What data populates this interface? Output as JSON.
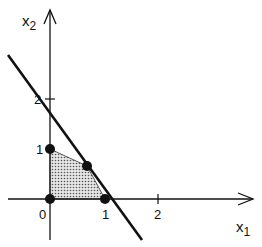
{
  "diagram": {
    "type": "linear-program-feasible-region",
    "axes": {
      "x_label": "x",
      "x_subscript": "1",
      "y_label": "x",
      "y_subscript": "2"
    },
    "ticks": {
      "x": [
        {
          "value": 0,
          "label": "0"
        },
        {
          "value": 1,
          "label": "1"
        },
        {
          "value": 2,
          "label": "2"
        }
      ],
      "y": [
        {
          "value": 1,
          "label": "1"
        },
        {
          "value": 2,
          "label": "2"
        }
      ]
    },
    "constraint_line": {
      "description": "boundary line crossing x2-axis near 1.9 and x1-axis near 1.1"
    },
    "feasible_region_vertices": [
      {
        "x1": 0,
        "x2": 0
      },
      {
        "x1": 1,
        "x2": 0
      },
      {
        "x1": 0.7,
        "x2": 0.65
      },
      {
        "x1": 0,
        "x2": 1
      }
    ],
    "marked_points": [
      {
        "name": "origin",
        "x1": 0,
        "x2": 0
      },
      {
        "name": "x1-intercept",
        "x1": 1,
        "x2": 0
      },
      {
        "name": "interior-vertex",
        "x1": 0.7,
        "x2": 0.65
      },
      {
        "name": "x2-intercept",
        "x1": 0,
        "x2": 1
      }
    ],
    "colors": {
      "ink": "#111111",
      "region_fill": "#cfcfcf",
      "background": "#ffffff"
    }
  }
}
